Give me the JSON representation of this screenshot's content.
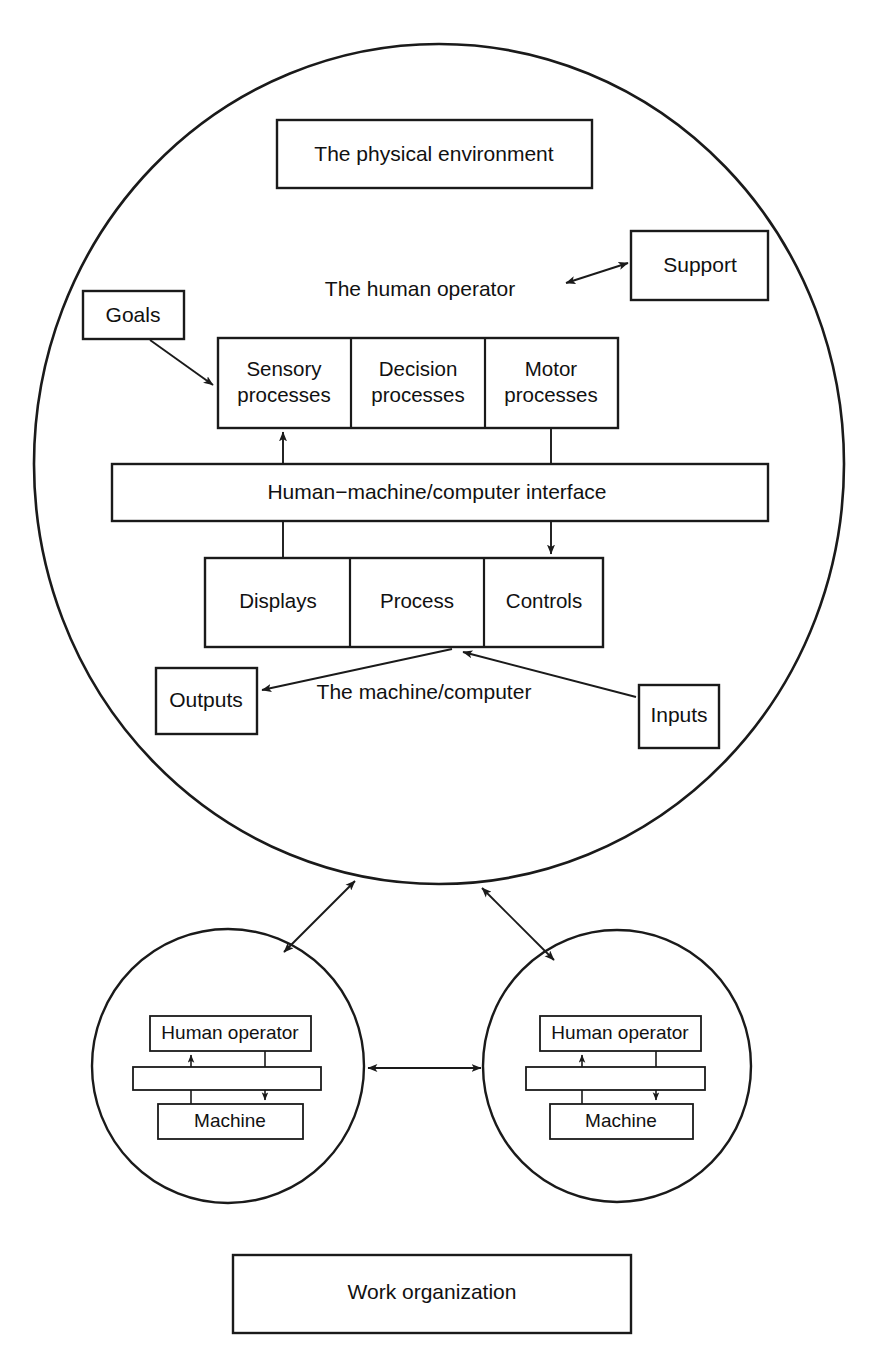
{
  "figure": {
    "kind": "systems-ergonomics-diagram",
    "background_color": "#ffffff",
    "line_color": "#1a1a1a"
  },
  "main_system": {
    "environment_box": "The physical environment",
    "human_operator_label": "The human operator",
    "machine_label": "The machine/computer",
    "goals_box": "Goals",
    "support_box": "Support",
    "outputs_box": "Outputs",
    "inputs_box": "Inputs",
    "interface_bar": "Human−machine/computer interface",
    "operator_cells": [
      {
        "line1": "Sensory",
        "line2": "processes"
      },
      {
        "line1": "Decision",
        "line2": "processes"
      },
      {
        "line1": "Motor",
        "line2": "processes"
      }
    ],
    "machine_cells": [
      {
        "label": "Displays"
      },
      {
        "label": "Process"
      },
      {
        "label": "Controls"
      }
    ]
  },
  "sub_systems": [
    {
      "id": "left",
      "operator_box": "Human operator",
      "interface_bar": "",
      "machine_box": "Machine"
    },
    {
      "id": "right",
      "operator_box": "Human operator",
      "interface_bar": "",
      "machine_box": "Machine"
    }
  ],
  "footer": {
    "work_organization_box": "Work organization"
  }
}
